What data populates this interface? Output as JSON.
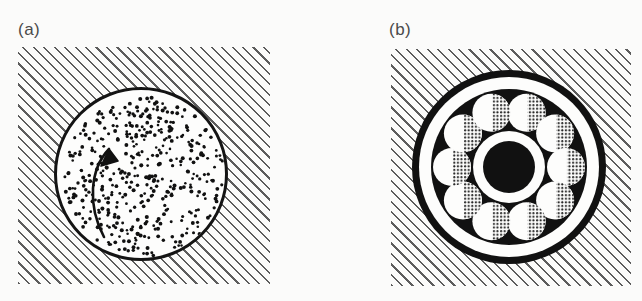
{
  "figure": {
    "background_color": "#fbfbfa",
    "ink_color": "#141414",
    "hatch_color": "#5c5c5c",
    "width": 642,
    "height": 301
  },
  "panels": [
    {
      "id": "a",
      "label": "(a)",
      "caption_text": "(a)",
      "subject": "stippled-disc-in-hatched-matrix",
      "hatched_field": {
        "x": 18,
        "y": 47,
        "width": 252,
        "height": 237,
        "angle_deg": 45,
        "line_spacing_px": 7.4,
        "line_width_px": 1.6,
        "color": "#5c5c5c"
      },
      "disc": {
        "center_x": 141,
        "center_y": 174,
        "radius": 87,
        "fill": "#fdfdfc",
        "outline_color": "#141414",
        "outline_width": 3,
        "fill_pattern": "random-stipple-dots",
        "dot_count": 430,
        "dot_radius_px": 1.6,
        "dot_color": "#111111"
      },
      "rotation_arrow": {
        "direction": "counterclockwise",
        "color": "#111111",
        "stroke_width": 2.6,
        "arrowhead": "solid-triangle"
      }
    },
    {
      "id": "b",
      "label": "(b)",
      "caption_text": "(b)",
      "subject": "ball-bearing-cross-section-in-hatched-matrix",
      "hatched_field": {
        "x": 391,
        "y": 49,
        "width": 240,
        "height": 237,
        "angle_deg": 45,
        "line_spacing_px": 7.4,
        "line_width_px": 1.6,
        "color": "#5c5c5c"
      },
      "bearing": {
        "center_x": 509,
        "center_y": 167,
        "outer_rim_radius": 97,
        "outer_rim_color": "#111111",
        "outer_rim_thickness": 6,
        "white_gap_radius": 90,
        "white_gap_color": "#fdfdfc",
        "race_outer_radius": 78,
        "race_color": "#111111",
        "race_inner_radius": 36,
        "hub_ring_outer_radius": 36,
        "hub_ring_color": "#fdfdfc",
        "hub_radius": 26,
        "hub_color": "#111111",
        "ball_count": 10,
        "ball_orbit_radius": 57,
        "ball_radius": 19,
        "ball_fill": "#fdfdfc",
        "ball_shading": "stippled-crosshatch-right-half",
        "ball_shade_color": "#2a2a2a"
      }
    }
  ]
}
